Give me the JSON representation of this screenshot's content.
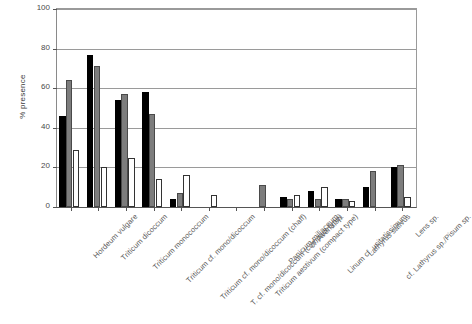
{
  "chart_data": {
    "type": "bar",
    "title": "",
    "subtitle": "",
    "xlabel": "",
    "ylabel": "% presence",
    "ylim": [
      0,
      100
    ],
    "yticks": [
      0,
      20,
      40,
      60,
      80,
      100
    ],
    "grid": true,
    "legend": "none",
    "legend_entries": [],
    "categories": [
      "Hordeum vulgare",
      "Triticum dicoccum",
      "Triticum monococcum",
      "Triticum cf. mono/dicoccum",
      "Triticum cf. mono/dicoccum (chaff)",
      "T. cf. mono/dicoccum (compact type)",
      "Triticum aestivum (compact type)",
      "Panicum miliaceum",
      "cf. Avena sp.",
      "Linum cf. usitatissimum",
      "Lathyrus sativus",
      "cf. Lathyrus sp./Pisum sp.",
      "Lens sp."
    ],
    "series": [
      {
        "name": "series-1",
        "color": "#000000",
        "values": [
          46,
          77,
          54,
          58,
          4,
          0,
          0,
          0,
          5,
          8,
          4,
          10,
          20
        ]
      },
      {
        "name": "series-2",
        "color": "#7d7d7d",
        "values": [
          64,
          71,
          57,
          47,
          7,
          0,
          0,
          11,
          4,
          4,
          4,
          18,
          21
        ]
      },
      {
        "name": "series-3",
        "color": "#ffffff",
        "values": [
          29,
          20,
          25,
          14,
          16,
          6,
          0,
          0,
          6,
          10,
          3,
          0,
          5
        ]
      }
    ]
  },
  "axis": {
    "y_title": "% presence",
    "y_tick_labels": [
      "100",
      "80",
      "60",
      "40",
      "20",
      "0"
    ]
  }
}
